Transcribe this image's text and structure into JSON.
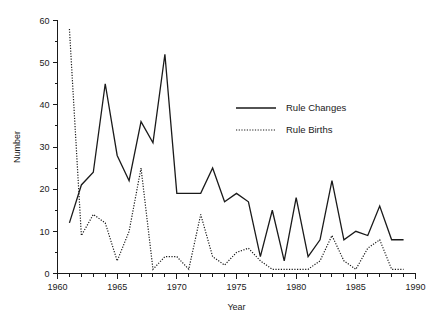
{
  "chart_data": {
    "type": "line",
    "title": "",
    "xlabel": "Year",
    "ylabel": "Number",
    "xlim": [
      1960,
      1990
    ],
    "ylim": [
      0,
      60
    ],
    "x_major_ticks": [
      1960,
      1965,
      1970,
      1975,
      1980,
      1985,
      1990
    ],
    "x_major_tick_labels": [
      "1960",
      "1965",
      "1970",
      "1975",
      "1980",
      "1985",
      "1990"
    ],
    "x_minor_tick_interval": 1,
    "y_major_ticks": [
      0,
      10,
      20,
      30,
      40,
      50,
      60
    ],
    "y_major_tick_labels": [
      "0",
      "10",
      "20",
      "30",
      "40",
      "50",
      "60"
    ],
    "y_minor_ticks": [
      5,
      15,
      25,
      35,
      45,
      55
    ],
    "grid": false,
    "legend_position": "upper-center-right",
    "x": [
      1961,
      1962,
      1963,
      1964,
      1965,
      1966,
      1967,
      1968,
      1969,
      1970,
      1971,
      1972,
      1973,
      1974,
      1975,
      1976,
      1977,
      1978,
      1979,
      1980,
      1981,
      1982,
      1983,
      1984,
      1985,
      1986,
      1987,
      1988,
      1989
    ],
    "series": [
      {
        "name": "Rule Changes",
        "style": "solid",
        "color": "#1a1a1a",
        "values": [
          12,
          21,
          24,
          45,
          28,
          22,
          36,
          31,
          52,
          19,
          19,
          19,
          25,
          17,
          19,
          17,
          4,
          15,
          3,
          18,
          4,
          8,
          22,
          8,
          10,
          9,
          16,
          8,
          8
        ]
      },
      {
        "name": "Rule Births",
        "style": "dotted",
        "color": "#1a1a1a",
        "values": [
          58,
          9,
          14,
          12,
          3,
          10,
          25,
          1,
          4,
          4,
          1,
          14,
          4,
          2,
          5,
          6,
          3,
          1,
          1,
          1,
          1,
          3,
          9,
          3,
          1,
          6,
          8,
          1,
          1
        ]
      }
    ]
  },
  "legend": {
    "entries": [
      {
        "label": "Rule Changes",
        "style": "solid"
      },
      {
        "label": "Rule Births",
        "style": "dotted"
      }
    ]
  }
}
